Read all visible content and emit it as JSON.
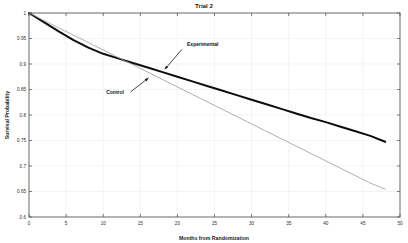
{
  "chart_data": {
    "type": "line",
    "title": "Trial 2",
    "xlabel": "Months from Randomization",
    "ylabel": "Survival Probability",
    "xlim": [
      0,
      50
    ],
    "ylim": [
      0.6,
      1.0
    ],
    "grid": true,
    "legend_position": "none",
    "xticks": [
      0,
      5,
      10,
      15,
      20,
      25,
      30,
      35,
      40,
      45,
      50
    ],
    "xtick_labels": [
      "0",
      "5",
      "10",
      "15",
      "20",
      "25",
      "30",
      "35",
      "40",
      "45",
      "50"
    ],
    "yticks": [
      0.6,
      0.65,
      0.7,
      0.75,
      0.8,
      0.85,
      0.9,
      0.95,
      1.0
    ],
    "ytick_labels": [
      "0.6",
      "0.65",
      "0.7",
      "0.75",
      "0.8",
      "0.85",
      "0.9",
      "0.95",
      "1"
    ],
    "x": [
      0,
      2,
      4,
      6,
      8,
      10,
      12,
      14,
      16,
      18,
      20,
      22,
      24,
      26,
      28,
      30,
      32,
      34,
      36,
      38,
      40,
      42,
      44,
      46,
      48
    ],
    "series": [
      {
        "name": "Experimental",
        "color": "#0d0d0d",
        "style": "solid-thick",
        "values": [
          1.0,
          0.982,
          0.964,
          0.947,
          0.932,
          0.92,
          0.911,
          0.902,
          0.893,
          0.884,
          0.875,
          0.866,
          0.857,
          0.848,
          0.839,
          0.83,
          0.821,
          0.812,
          0.803,
          0.794,
          0.786,
          0.777,
          0.768,
          0.759,
          0.7475
        ]
      },
      {
        "name": "Control",
        "color": "#9a9a9a",
        "style": "dotted-thin",
        "values": [
          1.0,
          0.9855,
          0.971,
          0.9565,
          0.942,
          0.9275,
          0.913,
          0.8985,
          0.884,
          0.8695,
          0.855,
          0.8405,
          0.826,
          0.8115,
          0.797,
          0.7825,
          0.768,
          0.7535,
          0.739,
          0.7245,
          0.71,
          0.6955,
          0.681,
          0.6665,
          0.6545
        ]
      }
    ],
    "annotations": [
      {
        "label": "Experimental",
        "text_x": 21.3,
        "text_y": 0.9355,
        "arrow_from_x": 20.6,
        "arrow_from_y": 0.9285,
        "arrow_to_x": 18.3,
        "arrow_to_y": 0.8895
      },
      {
        "label": "Control",
        "text_x": 10.4,
        "text_y": 0.8405,
        "arrow_from_x": 13.7,
        "arrow_from_y": 0.8455,
        "arrow_to_x": 16.1,
        "arrow_to_y": 0.8725
      }
    ]
  }
}
